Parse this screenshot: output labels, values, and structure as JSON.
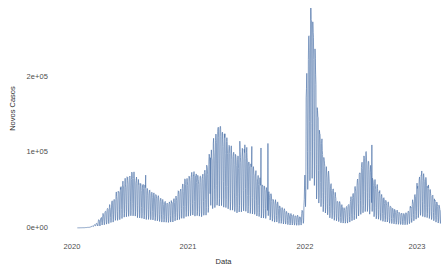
{
  "chart_data": {
    "type": "line",
    "title": "",
    "subtitle": "",
    "xlabel": "Data",
    "ylabel": "Novos Casos",
    "grid": false,
    "legend": "none",
    "line_color": "#5578ac",
    "background": "#ffffff",
    "axis_text_color": "#4d4d4d",
    "xlim": [
      "2020",
      "2023"
    ],
    "ylim": [
      0,
      240000
    ],
    "xtick_labels": [
      "2020",
      "2021",
      "2022",
      "2023"
    ],
    "xtick_values": [
      2020,
      2021,
      2022,
      2023
    ],
    "ytick_labels": [
      "0e+00",
      "1e+05",
      "2e+05"
    ],
    "ytick_values": [
      0,
      100000,
      200000
    ],
    "x": [
      2020.05,
      2020.1,
      2020.15,
      2020.18,
      2020.21,
      2020.24,
      2020.27,
      2020.3,
      2020.33,
      2020.36,
      2020.39,
      2020.42,
      2020.45,
      2020.48,
      2020.51,
      2020.54,
      2020.57,
      2020.6,
      2020.63,
      2020.66,
      2020.69,
      2020.72,
      2020.75,
      2020.78,
      2020.81,
      2020.84,
      2020.87,
      2020.9,
      2020.93,
      2020.96,
      2020.99,
      2021.02,
      2021.05,
      2021.08,
      2021.11,
      2021.14,
      2021.17,
      2021.2,
      2021.23,
      2021.26,
      2021.29,
      2021.32,
      2021.35,
      2021.38,
      2021.41,
      2021.44,
      2021.47,
      2021.5,
      2021.53,
      2021.56,
      2021.59,
      2021.62,
      2021.65,
      2021.68,
      2021.71,
      2021.74,
      2021.77,
      2021.8,
      2021.83,
      2021.86,
      2021.89,
      2021.92,
      2021.95,
      2021.98,
      2022.01,
      2022.04,
      2022.07,
      2022.1,
      2022.13,
      2022.16,
      2022.19,
      2022.22,
      2022.25,
      2022.28,
      2022.31,
      2022.34,
      2022.37,
      2022.4,
      2022.43,
      2022.46,
      2022.49,
      2022.52,
      2022.55,
      2022.58,
      2022.61,
      2022.64,
      2022.67,
      2022.7,
      2022.73,
      2022.76,
      2022.79,
      2022.82,
      2022.85,
      2022.88,
      2022.91,
      2022.94,
      2022.97,
      2023.0,
      2023.03,
      2023.06,
      2023.09,
      2023.12,
      2023.15,
      2023.18,
      2023.21,
      2023.24
    ],
    "values": [
      200,
      400,
      900,
      2500,
      5000,
      9000,
      14000,
      18000,
      22000,
      28000,
      34000,
      40000,
      45000,
      50000,
      54000,
      52000,
      48000,
      44000,
      41000,
      38000,
      36000,
      33000,
      30000,
      28000,
      26000,
      25000,
      27000,
      31000,
      36000,
      42000,
      48000,
      52000,
      55000,
      52000,
      50000,
      54000,
      62000,
      72000,
      85000,
      95000,
      100000,
      92000,
      84000,
      78000,
      72000,
      68000,
      74000,
      80000,
      70000,
      62000,
      56000,
      50000,
      44000,
      40000,
      36000,
      30000,
      26000,
      22000,
      19000,
      16000,
      14000,
      13000,
      12000,
      11000,
      22000,
      160000,
      230000,
      190000,
      120000,
      90000,
      70000,
      54000,
      42000,
      34000,
      27000,
      22000,
      20000,
      24000,
      32000,
      42000,
      55000,
      70000,
      75000,
      62000,
      50000,
      42000,
      36000,
      30000,
      26000,
      22000,
      19000,
      17000,
      15000,
      14000,
      16000,
      22000,
      32000,
      44000,
      55000,
      50000,
      42000,
      35000,
      28000,
      22000,
      17000,
      12000
    ]
  },
  "axes": {
    "y_title": "Novos Casos",
    "x_title": "Data",
    "y_ticks": [
      {
        "label": "2e+05",
        "top": 73
      },
      {
        "label": "1e+05",
        "top": 148
      },
      {
        "label": "0e+00",
        "top": 224
      }
    ],
    "x_ticks": [
      {
        "label": "2020",
        "left": 72
      },
      {
        "label": "2021",
        "left": 188
      },
      {
        "label": "2022",
        "left": 305
      },
      {
        "label": "2023",
        "left": 417
      }
    ]
  }
}
